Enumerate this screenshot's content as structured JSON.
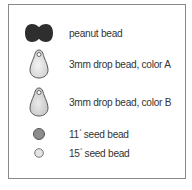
{
  "legend": {
    "items": [
      {
        "icon": "peanut-bead-icon",
        "label": "peanut bead",
        "color": "#2e2e2e"
      },
      {
        "icon": "drop-bead-icon",
        "label": "3mm drop bead, color A",
        "color": "#e6e6e6"
      },
      {
        "icon": "drop-bead-icon",
        "label": "3mm drop bead, color B",
        "color": "#dcdcdc"
      },
      {
        "icon": "seed-bead-icon",
        "label_main": "11",
        "label_sup": "°",
        "label_rest": " seed bead",
        "color": "#8c8c8c"
      },
      {
        "icon": "seed-bead-icon",
        "label_main": "15",
        "label_sup": "°",
        "label_rest": " seed bead",
        "color": "#e0e0e0"
      }
    ]
  }
}
